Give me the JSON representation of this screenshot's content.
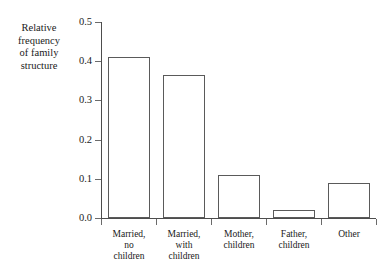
{
  "chart_data": {
    "type": "bar",
    "title": "",
    "subtitle": "",
    "xlabel": "",
    "ylabel": "Relative\nfrequency\nof family\nstructure",
    "categories": [
      "Married,\nno\nchildren",
      "Married,\nwith\nchildren",
      "Mother,\nchildren",
      "Father,\nchildren",
      "Other"
    ],
    "values": [
      0.41,
      0.365,
      0.11,
      0.02,
      0.09
    ],
    "ylim": [
      0.0,
      0.5
    ],
    "ytick_labels": [
      "0.5",
      "0.4",
      "0.3",
      "0.2",
      "0.1",
      "0.0"
    ],
    "ytick_values": [
      0.5,
      0.4,
      0.3,
      0.2,
      0.1,
      0.0
    ],
    "grid": false,
    "legend": null,
    "bar_fill_color": "#ffffff",
    "bar_edge_color": "#5a5a5a",
    "axis_color": "#4d4d4d",
    "text_color": "#1a1a1a",
    "background_color": "#ffffff"
  }
}
